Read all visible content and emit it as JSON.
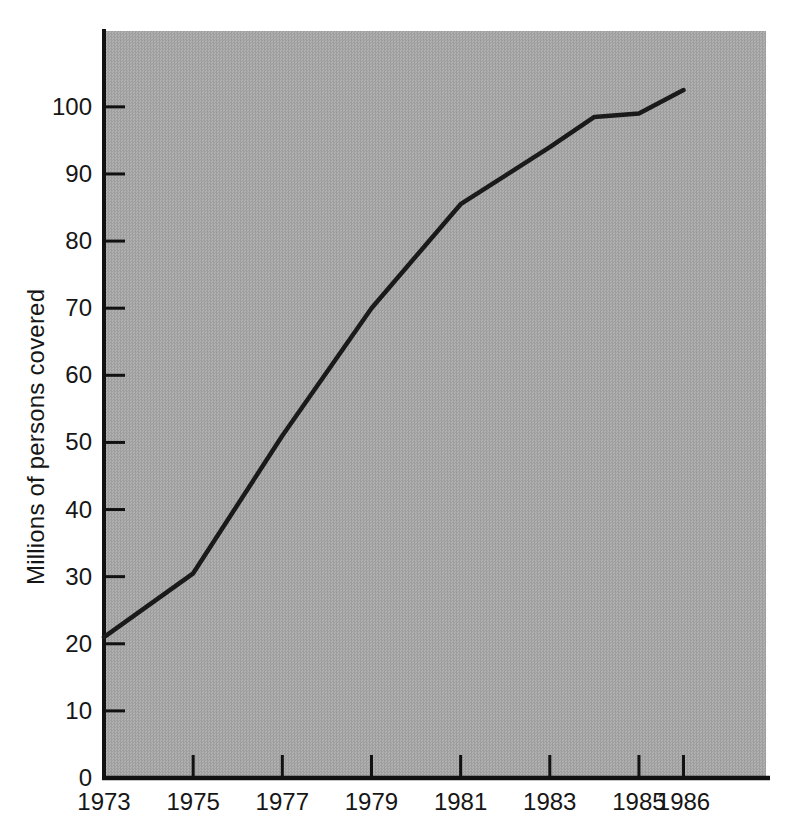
{
  "chart_data": {
    "type": "line",
    "title": "",
    "xlabel": "",
    "ylabel": "Millions of persons covered",
    "series": [
      {
        "name": "persons-covered",
        "points": [
          {
            "x": 1973,
            "y": 21
          },
          {
            "x": 1975,
            "y": 30.5
          },
          {
            "x": 1977,
            "y": 51
          },
          {
            "x": 1979,
            "y": 70
          },
          {
            "x": 1981,
            "y": 85.5
          },
          {
            "x": 1983,
            "y": 94
          },
          {
            "x": 1984,
            "y": 98.5
          },
          {
            "x": 1985,
            "y": 99
          },
          {
            "x": 1986,
            "y": 102.5
          }
        ]
      }
    ],
    "x_tick_labels": [
      "1973",
      "1975",
      "1977",
      "1979",
      "1981",
      "1983",
      "1985",
      "1986"
    ],
    "x_tick_mark_years": [
      1975,
      1977,
      1979,
      1981,
      1983,
      1985,
      1986
    ],
    "y_tick_labels": [
      "0",
      "10",
      "20",
      "30",
      "40",
      "50",
      "60",
      "70",
      "80",
      "90",
      "100"
    ],
    "xlim": [
      1973,
      1987.85
    ],
    "ylim": [
      0,
      111.3
    ],
    "grid": false,
    "legend_position": "none",
    "colors": {
      "line": "#1a1a1a",
      "axis": "#111111",
      "tick": "#111111",
      "plot_background": "#a7a7a7",
      "page_background": "#ffffff",
      "text": "#161616"
    }
  }
}
